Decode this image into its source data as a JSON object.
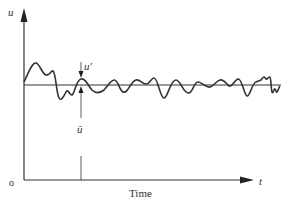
{
  "diagram": {
    "title": "",
    "y_axis_label": "u",
    "x_axis_label": "t",
    "x_axis_caption": "Time",
    "origin_label": "o",
    "fluctuation_label": "u'",
    "mean_label": "ū",
    "colors": {
      "line": "#333333",
      "background": "#ffffff"
    }
  }
}
